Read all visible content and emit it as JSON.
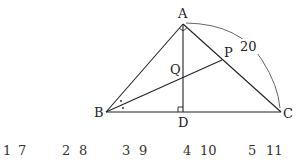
{
  "diagram": {
    "points": {
      "A": {
        "label": "A",
        "x": 183,
        "y": 24
      },
      "B": {
        "label": "B",
        "x": 106,
        "y": 112
      },
      "C": {
        "label": "C",
        "x": 281,
        "y": 112
      },
      "D": {
        "label": "D",
        "x": 183,
        "y": 112
      },
      "P": {
        "label": "P",
        "x": 222,
        "y": 60
      },
      "Q": {
        "label": "Q",
        "x": 183,
        "y": 77
      }
    },
    "arc_label": "20",
    "line_color": "#222222",
    "arc_color": "#555555"
  },
  "choices": [
    {
      "a": "1",
      "b": "7"
    },
    {
      "a": "2",
      "b": "8"
    },
    {
      "a": "3",
      "b": "9"
    },
    {
      "a": "4",
      "b": "10"
    },
    {
      "a": "5",
      "b": "11"
    }
  ]
}
